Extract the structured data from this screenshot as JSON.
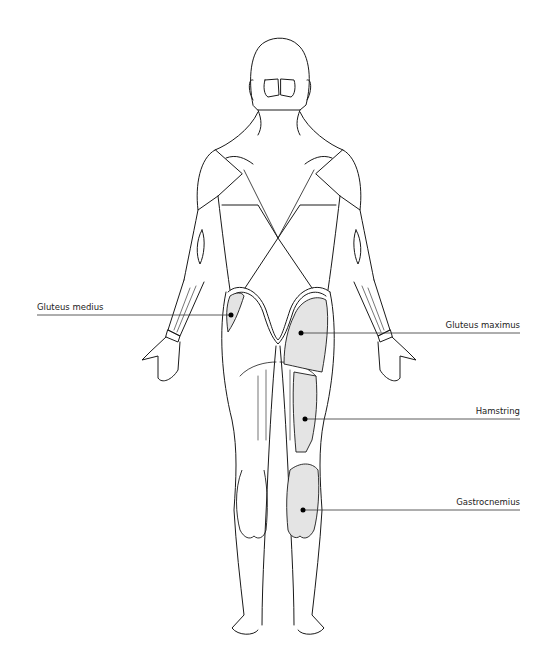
{
  "figure": {
    "fill_color": "#e4e4e4",
    "line_color": "#1a1a1a",
    "leader_color": "#333333"
  },
  "labels": [
    {
      "id": "gluteus-medius",
      "text": "Gluteus medius",
      "side": "left",
      "text_x": 37,
      "text_y": 302,
      "line_x1": 37,
      "line_x2": 231,
      "line_y": 315,
      "dot_x": 231,
      "dot_y": 315
    },
    {
      "id": "gluteus-maximus",
      "text": "Gluteus maximus",
      "side": "right",
      "text_x": 520,
      "text_y": 320,
      "line_x1": 301,
      "line_x2": 520,
      "line_y": 333,
      "dot_x": 301,
      "dot_y": 333
    },
    {
      "id": "hamstring",
      "text": "Hamstring",
      "side": "right",
      "text_x": 520,
      "text_y": 406,
      "line_x1": 305,
      "line_x2": 520,
      "line_y": 419,
      "dot_x": 305,
      "dot_y": 419
    },
    {
      "id": "gastrocnemius",
      "text": "Gastrocnemius",
      "side": "right",
      "text_x": 520,
      "text_y": 497,
      "line_x1": 303,
      "line_x2": 520,
      "line_y": 510,
      "dot_x": 303,
      "dot_y": 510
    }
  ]
}
